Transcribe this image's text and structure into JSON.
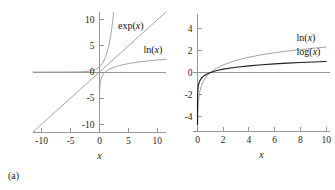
{
  "figure": {
    "background": "#ffffff",
    "curve_light_color": "#9a9a9a",
    "curve_dark_color": "#1f1f1f",
    "axis_color": "#8c8c8c"
  },
  "panels": [
    {
      "id": "a",
      "caption": "(a)",
      "xlabel": "x",
      "ylabel": "",
      "xticks": [
        "-10",
        "-5",
        "0",
        "5",
        "10"
      ],
      "xtick_values": [
        -10,
        -5,
        0,
        5,
        10
      ],
      "yticks": [
        "10",
        "5",
        "0",
        "-5",
        "-10"
      ],
      "ytick_values": [
        10,
        5,
        0,
        -5,
        -10
      ],
      "xlim": [
        -11.5,
        11.5
      ],
      "ylim": [
        -11.5,
        11.5
      ],
      "labels": [
        {
          "text": "exp(x)",
          "x": 3.2,
          "y": 8.3
        },
        {
          "text": "ln(x)",
          "x": 7.6,
          "y": 3.6
        }
      ]
    },
    {
      "id": "b",
      "caption": "(b)",
      "xlabel": "x",
      "ylabel": "",
      "xticks": [
        "0",
        "2",
        "4",
        "6",
        "8",
        "10"
      ],
      "xtick_values": [
        0,
        2,
        4,
        6,
        8,
        10
      ],
      "yticks": [
        "4",
        "2",
        "0",
        "-2",
        "-4"
      ],
      "ytick_values": [
        4,
        2,
        0,
        -2,
        -4
      ],
      "xlim": [
        -0.35,
        10.3
      ],
      "ylim": [
        -5.3,
        5.3
      ],
      "labels": [
        {
          "text": "ln(x)",
          "x": 7.7,
          "y": 2.85
        },
        {
          "text": "log(x)",
          "x": 7.7,
          "y": 1.55
        }
      ]
    }
  ],
  "chart_data": [
    {
      "type": "line",
      "panel": "a",
      "title": "",
      "xlabel": "x",
      "ylabel": "",
      "xlim": [
        -11.5,
        11.5
      ],
      "ylim": [
        -11.5,
        11.5
      ],
      "xticks": [
        -10,
        -5,
        0,
        5,
        10
      ],
      "yticks": [
        -10,
        -5,
        0,
        5,
        10
      ],
      "grid": false,
      "legend": "inline-annotations",
      "series": [
        {
          "name": "exp(x)",
          "color": "#9a9a9a",
          "function": "exp(x)",
          "x": [
            -11.5,
            -10,
            -8,
            -6,
            -5,
            -4,
            -3,
            -2.5,
            -2,
            -1.5,
            -1,
            -0.5,
            0,
            0.5,
            1,
            1.5,
            1.75,
            2,
            2.1,
            2.2,
            2.3,
            2.4,
            2.44
          ],
          "y": [
            0.0,
            0.0,
            0.0,
            0.002,
            0.007,
            0.018,
            0.05,
            0.082,
            0.135,
            0.223,
            0.368,
            0.607,
            1.0,
            1.649,
            2.718,
            4.482,
            5.755,
            7.389,
            8.166,
            9.025,
            9.974,
            11.02,
            11.5
          ]
        },
        {
          "name": "ln(x)",
          "color": "#9a9a9a",
          "function": "ln(x)",
          "x": [
            1e-05,
            0.0001,
            0.001,
            0.005,
            0.02,
            0.05,
            0.1,
            0.2,
            0.4,
            0.7,
            1.0,
            1.5,
            2,
            3,
            4,
            5,
            6,
            7,
            8,
            9,
            10,
            11,
            11.5
          ],
          "y": [
            -11.51,
            -9.21,
            -6.91,
            -5.3,
            -3.91,
            -3.0,
            -2.3,
            -1.61,
            -0.92,
            -0.36,
            0.0,
            0.405,
            0.693,
            1.099,
            1.386,
            1.609,
            1.792,
            1.946,
            2.079,
            2.197,
            2.303,
            2.398,
            2.442
          ]
        },
        {
          "name": "y = x",
          "color": "#9a9a9a",
          "function": "x",
          "x": [
            -11.5,
            11.5
          ],
          "y": [
            -11.5,
            11.5
          ]
        }
      ],
      "annotations": [
        {
          "text": "exp(x)",
          "x": 3.2,
          "y": 8.3
        },
        {
          "text": "ln(x)",
          "x": 7.6,
          "y": 3.6
        }
      ]
    },
    {
      "type": "line",
      "panel": "b",
      "title": "",
      "xlabel": "x",
      "ylabel": "",
      "xlim": [
        -0.35,
        10.3
      ],
      "ylim": [
        -5.3,
        5.3
      ],
      "xticks": [
        0,
        2,
        4,
        6,
        8,
        10
      ],
      "yticks": [
        -4,
        -2,
        0,
        2,
        4
      ],
      "grid": false,
      "legend": "inline-annotations",
      "series": [
        {
          "name": "ln(x)",
          "color": "#9a9a9a",
          "function": "ln(x)",
          "x": [
            0.005,
            0.01,
            0.02,
            0.04,
            0.08,
            0.15,
            0.25,
            0.4,
            0.6,
            0.8,
            1.0,
            1.5,
            2,
            3,
            4,
            5,
            6,
            7,
            8,
            9,
            10
          ],
          "y": [
            -5.3,
            -4.61,
            -3.91,
            -3.22,
            -2.53,
            -1.9,
            -1.39,
            -0.92,
            -0.51,
            -0.22,
            0.0,
            0.405,
            0.693,
            1.099,
            1.386,
            1.609,
            1.792,
            1.946,
            2.079,
            2.197,
            2.303
          ]
        },
        {
          "name": "log(x)",
          "color": "#1f1f1f",
          "function": "log10(x)",
          "x": [
            2e-05,
            0.0001,
            0.0005,
            0.002,
            0.01,
            0.03,
            0.07,
            0.15,
            0.3,
            0.5,
            0.7,
            1.0,
            1.5,
            2,
            3,
            4,
            5,
            6,
            7,
            8,
            9,
            10
          ],
          "y": [
            -4.7,
            -4.0,
            -3.3,
            -2.7,
            -2.0,
            -1.52,
            -1.155,
            -0.824,
            -0.523,
            -0.301,
            -0.155,
            0.0,
            0.176,
            0.301,
            0.477,
            0.602,
            0.699,
            0.778,
            0.845,
            0.903,
            0.954,
            1.0
          ]
        }
      ],
      "annotations": [
        {
          "text": "ln(x)",
          "x": 7.7,
          "y": 2.85
        },
        {
          "text": "log(x)",
          "x": 7.7,
          "y": 1.55
        }
      ]
    }
  ]
}
